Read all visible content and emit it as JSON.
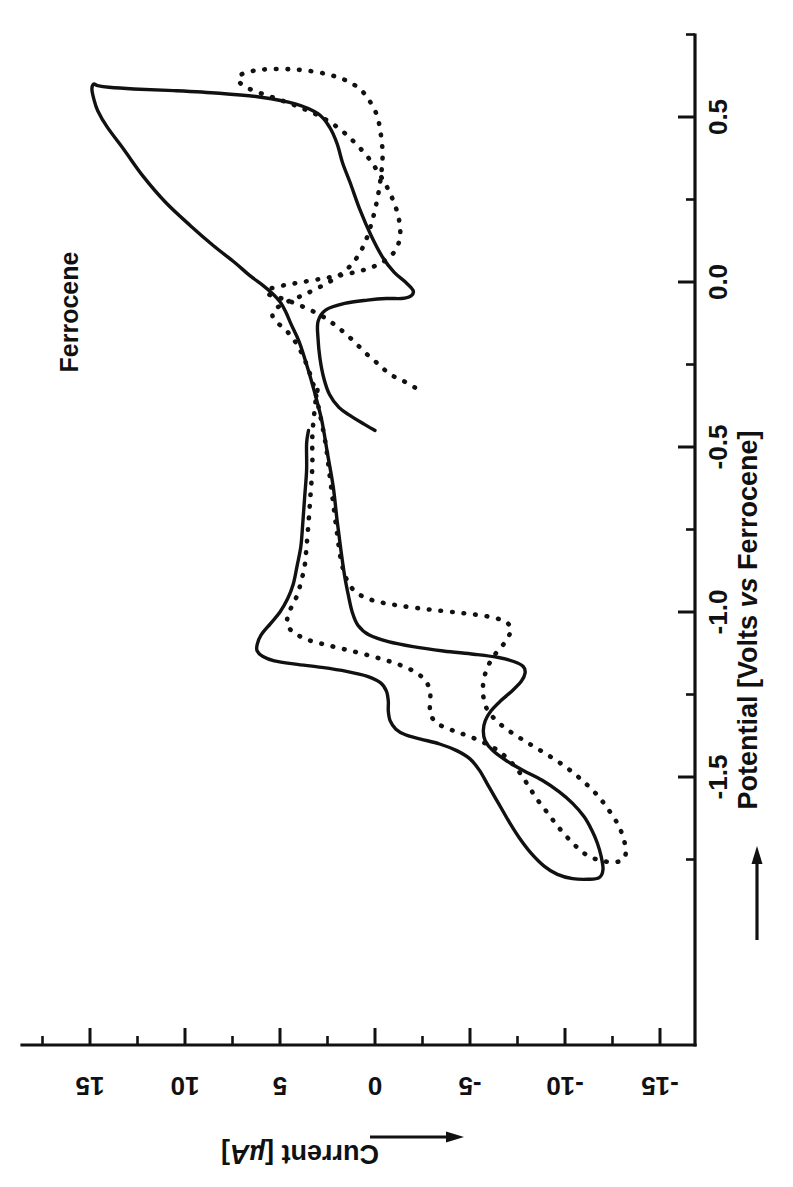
{
  "figure": {
    "background_color": "#ffffff",
    "ink_color": "#111111",
    "orientation_note": "rotated-90-ccw"
  },
  "annotations": [
    {
      "name": "ferrocene-label",
      "text": "Ferrocene"
    }
  ],
  "chart_data": {
    "type": "line",
    "title": "",
    "subtitle": "",
    "plot_kind": "cyclic-voltammogram",
    "xlabel": "Potential [Volts vs Ferrocene]",
    "xlabel_parts": {
      "main": "Potential [Volts ",
      "italic": "vs",
      "tail": " Ferrocene]"
    },
    "ylabel": "Current [µA]",
    "ylabel_parts": {
      "main": "Current [",
      "italic": "µA",
      "tail": "]"
    },
    "xlim": [
      -1.9,
      0.72
    ],
    "ylim": [
      -16.5,
      17.0
    ],
    "xticks": [
      0.5,
      0.0,
      -0.5,
      -1.0,
      -1.5
    ],
    "xtick_labels": [
      "0.5",
      "0.0",
      "-0.5",
      "-1.0",
      "-1.5"
    ],
    "xtick_minor_step": 0.25,
    "yticks": [
      15,
      10,
      5,
      0,
      -5,
      -10,
      -15
    ],
    "ytick_labels": [
      "15",
      "10",
      "5",
      "0",
      "-5",
      "-10",
      "-15"
    ],
    "ytick_minor_step": 2.5,
    "grid": false,
    "legend_position": "none",
    "axis_arrows": {
      "x": "increasing-toward-positive",
      "y": "increasing-toward-positive"
    },
    "series": [
      {
        "name": "solid trace",
        "style": "solid",
        "color": "#111111",
        "points": [
          [
            -0.45,
            0.0
          ],
          [
            -0.43,
            0.6
          ],
          [
            -0.405,
            1.3
          ],
          [
            -0.38,
            1.9
          ],
          [
            -0.34,
            2.4
          ],
          [
            -0.29,
            2.7
          ],
          [
            -0.23,
            2.9
          ],
          [
            -0.17,
            3.0
          ],
          [
            -0.12,
            3.0
          ],
          [
            -0.085,
            2.6
          ],
          [
            -0.065,
            1.6
          ],
          [
            -0.055,
            0.4
          ],
          [
            -0.05,
            -0.6
          ],
          [
            -0.05,
            -1.4
          ],
          [
            -0.042,
            -1.9
          ],
          [
            -0.025,
            -2.0
          ],
          [
            0.0,
            -1.6
          ],
          [
            0.03,
            -1.0
          ],
          [
            0.075,
            -0.4
          ],
          [
            0.14,
            0.2
          ],
          [
            0.22,
            0.8
          ],
          [
            0.3,
            1.3
          ],
          [
            0.36,
            1.7
          ],
          [
            0.42,
            2.0
          ],
          [
            0.47,
            2.4
          ],
          [
            0.51,
            3.0
          ],
          [
            0.54,
            4.2
          ],
          [
            0.56,
            6.0
          ],
          [
            0.572,
            8.2
          ],
          [
            0.58,
            10.6
          ],
          [
            0.585,
            12.7
          ],
          [
            0.59,
            14.0
          ],
          [
            0.595,
            14.6
          ],
          [
            0.6,
            14.8
          ],
          [
            0.585,
            14.9
          ],
          [
            0.555,
            14.8
          ],
          [
            0.52,
            14.6
          ],
          [
            0.47,
            14.1
          ],
          [
            0.4,
            13.2
          ],
          [
            0.32,
            12.2
          ],
          [
            0.24,
            11.0
          ],
          [
            0.17,
            9.7
          ],
          [
            0.11,
            8.5
          ],
          [
            0.06,
            7.4
          ],
          [
            0.02,
            6.6
          ],
          [
            -0.01,
            5.9
          ],
          [
            -0.035,
            5.4
          ],
          [
            -0.06,
            5.0
          ],
          [
            -0.09,
            4.7
          ],
          [
            -0.13,
            4.4
          ],
          [
            -0.18,
            4.0
          ],
          [
            -0.25,
            3.6
          ],
          [
            -0.33,
            3.2
          ],
          [
            -0.42,
            2.8
          ],
          [
            -0.52,
            2.5
          ],
          [
            -0.62,
            2.2
          ],
          [
            -0.72,
            2.0
          ],
          [
            -0.81,
            1.8
          ],
          [
            -0.89,
            1.6
          ],
          [
            -0.95,
            1.4
          ],
          [
            -1.0,
            1.2
          ],
          [
            -1.04,
            0.9
          ],
          [
            -1.07,
            0.3
          ],
          [
            -1.09,
            -0.7
          ],
          [
            -1.105,
            -2.0
          ],
          [
            -1.118,
            -3.6
          ],
          [
            -1.128,
            -5.2
          ],
          [
            -1.138,
            -6.5
          ],
          [
            -1.15,
            -7.3
          ],
          [
            -1.165,
            -7.8
          ],
          [
            -1.185,
            -7.9
          ],
          [
            -1.21,
            -7.7
          ],
          [
            -1.24,
            -7.2
          ],
          [
            -1.27,
            -6.6
          ],
          [
            -1.3,
            -6.1
          ],
          [
            -1.33,
            -5.8
          ],
          [
            -1.36,
            -5.7
          ],
          [
            -1.39,
            -5.8
          ],
          [
            -1.42,
            -6.2
          ],
          [
            -1.45,
            -6.9
          ],
          [
            -1.48,
            -7.8
          ],
          [
            -1.51,
            -8.8
          ],
          [
            -1.545,
            -9.7
          ],
          [
            -1.58,
            -10.4
          ],
          [
            -1.62,
            -11.0
          ],
          [
            -1.66,
            -11.4
          ],
          [
            -1.7,
            -11.7
          ],
          [
            -1.74,
            -11.9
          ],
          [
            -1.78,
            -12.0
          ],
          [
            -1.805,
            -11.8
          ],
          [
            -1.81,
            -11.2
          ],
          [
            -1.808,
            -10.4
          ],
          [
            -1.795,
            -9.6
          ],
          [
            -1.77,
            -8.9
          ],
          [
            -1.73,
            -8.2
          ],
          [
            -1.685,
            -7.6
          ],
          [
            -1.64,
            -7.1
          ],
          [
            -1.6,
            -6.7
          ],
          [
            -1.56,
            -6.3
          ],
          [
            -1.52,
            -5.9
          ],
          [
            -1.48,
            -5.5
          ],
          [
            -1.445,
            -5.0
          ],
          [
            -1.42,
            -4.3
          ],
          [
            -1.4,
            -3.4
          ],
          [
            -1.385,
            -2.4
          ],
          [
            -1.372,
            -1.6
          ],
          [
            -1.355,
            -1.1
          ],
          [
            -1.33,
            -0.8
          ],
          [
            -1.3,
            -0.7
          ],
          [
            -1.27,
            -0.7
          ],
          [
            -1.24,
            -0.6
          ],
          [
            -1.215,
            -0.3
          ],
          [
            -1.195,
            0.4
          ],
          [
            -1.18,
            1.5
          ],
          [
            -1.168,
            2.8
          ],
          [
            -1.158,
            4.2
          ],
          [
            -1.148,
            5.3
          ],
          [
            -1.135,
            5.9
          ],
          [
            -1.118,
            6.2
          ],
          [
            -1.098,
            6.2
          ],
          [
            -1.07,
            6.0
          ],
          [
            -1.035,
            5.5
          ],
          [
            -1.0,
            5.0
          ],
          [
            -0.96,
            4.6
          ],
          [
            -0.915,
            4.3
          ],
          [
            -0.86,
            4.1
          ],
          [
            -0.8,
            3.9
          ],
          [
            -0.73,
            3.8
          ],
          [
            -0.65,
            3.7
          ],
          [
            -0.57,
            3.6
          ],
          [
            -0.49,
            3.6
          ],
          [
            -0.45,
            3.5
          ]
        ]
      },
      {
        "name": "dotted trace",
        "style": "dotted",
        "color": "#111111",
        "points": [
          [
            -0.32,
            -2.1
          ],
          [
            -0.3,
            -1.5
          ],
          [
            -0.28,
            -0.8
          ],
          [
            -0.25,
            -0.2
          ],
          [
            -0.215,
            0.5
          ],
          [
            -0.175,
            1.2
          ],
          [
            -0.14,
            1.9
          ],
          [
            -0.11,
            2.6
          ],
          [
            -0.085,
            3.4
          ],
          [
            -0.065,
            4.2
          ],
          [
            -0.05,
            4.9
          ],
          [
            -0.04,
            5.5
          ],
          [
            -0.03,
            5.7
          ],
          [
            -0.02,
            5.5
          ],
          [
            -0.01,
            4.8
          ],
          [
            0.0,
            3.8
          ],
          [
            0.012,
            2.6
          ],
          [
            0.025,
            1.4
          ],
          [
            0.04,
            0.4
          ],
          [
            0.06,
            -0.4
          ],
          [
            0.09,
            -1.0
          ],
          [
            0.13,
            -1.3
          ],
          [
            0.175,
            -1.3
          ],
          [
            0.225,
            -1.1
          ],
          [
            0.28,
            -0.7
          ],
          [
            0.33,
            -0.2
          ],
          [
            0.38,
            0.4
          ],
          [
            0.43,
            1.2
          ],
          [
            0.47,
            2.0
          ],
          [
            0.505,
            3.0
          ],
          [
            0.535,
            4.2
          ],
          [
            0.56,
            5.4
          ],
          [
            0.58,
            6.4
          ],
          [
            0.598,
            7.0
          ],
          [
            0.615,
            7.2
          ],
          [
            0.63,
            7.0
          ],
          [
            0.64,
            6.4
          ],
          [
            0.645,
            5.6
          ],
          [
            0.645,
            4.6
          ],
          [
            0.64,
            3.5
          ],
          [
            0.628,
            2.4
          ],
          [
            0.61,
            1.5
          ],
          [
            0.585,
            0.8
          ],
          [
            0.55,
            0.3
          ],
          [
            0.505,
            -0.1
          ],
          [
            0.45,
            -0.3
          ],
          [
            0.385,
            -0.4
          ],
          [
            0.315,
            -0.3
          ],
          [
            0.245,
            -0.1
          ],
          [
            0.175,
            0.2
          ],
          [
            0.11,
            0.6
          ],
          [
            0.055,
            1.2
          ],
          [
            0.015,
            2.0
          ],
          [
            -0.015,
            2.9
          ],
          [
            -0.04,
            3.8
          ],
          [
            -0.06,
            4.6
          ],
          [
            -0.08,
            5.2
          ],
          [
            -0.1,
            5.4
          ],
          [
            -0.12,
            5.2
          ],
          [
            -0.14,
            4.8
          ],
          [
            -0.165,
            4.4
          ],
          [
            -0.2,
            4.0
          ],
          [
            -0.25,
            3.6
          ],
          [
            -0.32,
            3.2
          ],
          [
            -0.4,
            2.9
          ],
          [
            -0.49,
            2.6
          ],
          [
            -0.58,
            2.4
          ],
          [
            -0.67,
            2.2
          ],
          [
            -0.76,
            2.0
          ],
          [
            -0.84,
            1.8
          ],
          [
            -0.9,
            1.5
          ],
          [
            -0.94,
            1.0
          ],
          [
            -0.965,
            0.1
          ],
          [
            -0.98,
            -1.2
          ],
          [
            -0.992,
            -2.8
          ],
          [
            -1.002,
            -4.4
          ],
          [
            -1.012,
            -5.8
          ],
          [
            -1.025,
            -6.7
          ],
          [
            -1.042,
            -7.1
          ],
          [
            -1.065,
            -7.1
          ],
          [
            -1.095,
            -6.8
          ],
          [
            -1.13,
            -6.3
          ],
          [
            -1.17,
            -5.9
          ],
          [
            -1.215,
            -5.7
          ],
          [
            -1.255,
            -5.7
          ],
          [
            -1.295,
            -5.9
          ],
          [
            -1.33,
            -6.4
          ],
          [
            -1.362,
            -7.1
          ],
          [
            -1.395,
            -8.0
          ],
          [
            -1.43,
            -9.0
          ],
          [
            -1.468,
            -10.0
          ],
          [
            -1.51,
            -10.9
          ],
          [
            -1.555,
            -11.7
          ],
          [
            -1.6,
            -12.3
          ],
          [
            -1.645,
            -12.8
          ],
          [
            -1.69,
            -13.1
          ],
          [
            -1.73,
            -13.2
          ],
          [
            -1.752,
            -13.0
          ],
          [
            -1.758,
            -12.5
          ],
          [
            -1.752,
            -11.8
          ],
          [
            -1.735,
            -11.1
          ],
          [
            -1.7,
            -10.4
          ],
          [
            -1.655,
            -9.7
          ],
          [
            -1.61,
            -9.1
          ],
          [
            -1.565,
            -8.5
          ],
          [
            -1.52,
            -8.0
          ],
          [
            -1.478,
            -7.5
          ],
          [
            -1.44,
            -6.9
          ],
          [
            -1.41,
            -6.2
          ],
          [
            -1.385,
            -5.3
          ],
          [
            -1.365,
            -4.4
          ],
          [
            -1.348,
            -3.6
          ],
          [
            -1.328,
            -3.1
          ],
          [
            -1.302,
            -2.9
          ],
          [
            -1.272,
            -2.9
          ],
          [
            -1.242,
            -2.9
          ],
          [
            -1.212,
            -2.7
          ],
          [
            -1.185,
            -2.2
          ],
          [
            -1.16,
            -1.3
          ],
          [
            -1.14,
            -0.2
          ],
          [
            -1.12,
            1.1
          ],
          [
            -1.102,
            2.4
          ],
          [
            -1.085,
            3.5
          ],
          [
            -1.065,
            4.2
          ],
          [
            -1.042,
            4.6
          ],
          [
            -1.015,
            4.6
          ],
          [
            -0.985,
            4.4
          ],
          [
            -0.95,
            4.1
          ],
          [
            -0.91,
            3.9
          ],
          [
            -0.86,
            3.7
          ],
          [
            -0.8,
            3.6
          ],
          [
            -0.73,
            3.5
          ],
          [
            -0.65,
            3.4
          ],
          [
            -0.56,
            3.3
          ],
          [
            -0.47,
            3.3
          ],
          [
            -0.4,
            3.2
          ],
          [
            -0.35,
            3.1
          ],
          [
            -0.32,
            3.0
          ]
        ]
      }
    ]
  }
}
